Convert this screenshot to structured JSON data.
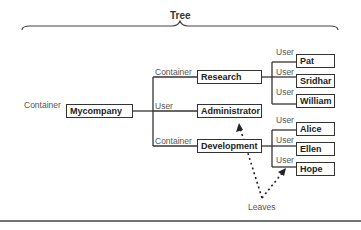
{
  "title": "Tree",
  "root": {
    "type": "Container",
    "name": "Mycompany"
  },
  "level1": [
    {
      "type": "Container",
      "name": "Research"
    },
    {
      "type": "User",
      "name": "Administrator"
    },
    {
      "type": "Container",
      "name": "Development"
    }
  ],
  "leaves_research": [
    {
      "type": "User",
      "name": "Pat"
    },
    {
      "type": "User",
      "name": "Sridhar"
    },
    {
      "type": "User",
      "name": "William"
    }
  ],
  "leaves_development": [
    {
      "type": "User",
      "name": "Alice"
    },
    {
      "type": "User",
      "name": "Ellen"
    },
    {
      "type": "User",
      "name": "Hope"
    }
  ],
  "annotation": "Leaves",
  "colors": {
    "line": "#333333",
    "label": "#555555"
  }
}
